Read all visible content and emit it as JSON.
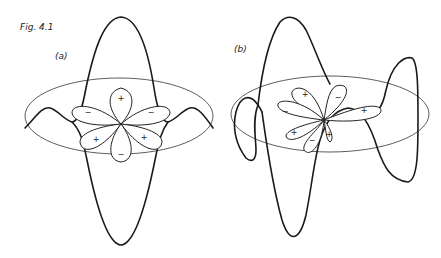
{
  "figure": {
    "title": "Fig. 4.1",
    "panels": [
      {
        "label": "(a)",
        "description": "Undistorted: six-lobed angular function in a ring plane with vertical wave crossing ring symmetrically",
        "petal_signs": [
          "+",
          "−",
          "+",
          "−",
          "+",
          "−"
        ]
      },
      {
        "label": "(b)",
        "description": "Distorted: rotated six-lobed function with wave oscillating around ring asymmetrically",
        "petal_signs": [
          "+",
          "−",
          "+",
          "−",
          "+",
          "−",
          "+"
        ]
      }
    ]
  }
}
